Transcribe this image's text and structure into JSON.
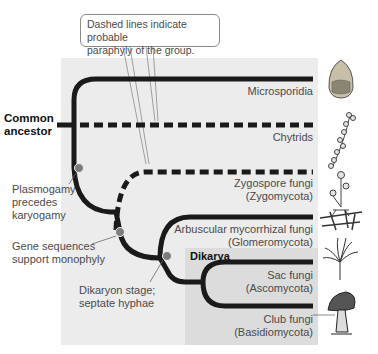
{
  "callout": {
    "line1": "Dashed lines indicate probable",
    "line2": "paraphyly of the group."
  },
  "root": {
    "line1": "Common",
    "line2": "ancestor"
  },
  "taxa": [
    {
      "line1": "Microsporidia",
      "line2": "",
      "style": "solid",
      "icon": "microsporidia-spore-icon"
    },
    {
      "line1": "Chytrids",
      "line2": "",
      "style": "dashed",
      "icon": "chytrid-icon"
    },
    {
      "line1": "Zygospore fungi",
      "line2": "(Zygomycota)",
      "style": "dashed",
      "icon": "zygospore-fungi-icon"
    },
    {
      "line1": "Arbuscular mycorrhizal fungi",
      "line2": "(Glomeromycota)",
      "style": "solid",
      "icon": "mycorrhizal-fungi-icon"
    },
    {
      "line1": "Sac fungi",
      "line2": "(Ascomycota)",
      "style": "solid",
      "icon": "sac-fungi-icon"
    },
    {
      "line1": "Club fungi",
      "line2": "(Basidiomycota)",
      "style": "solid",
      "icon": "mushroom-icon"
    }
  ],
  "characters": [
    {
      "line1": "Plasmogamy",
      "line2": "precedes",
      "line3": "karyogamy"
    },
    {
      "line1": "Gene sequences",
      "line2": "support monophyly"
    },
    {
      "line1": "Dikaryon stage;",
      "line2": "septate hyphae"
    }
  ],
  "group": {
    "label": "Dikarya"
  },
  "colors": {
    "panel": "#ececec",
    "dikarya_panel": "#dcdcdc",
    "branch": "#1a1a1a",
    "node": "#7d7d7d",
    "text": "#4a4a4a"
  }
}
